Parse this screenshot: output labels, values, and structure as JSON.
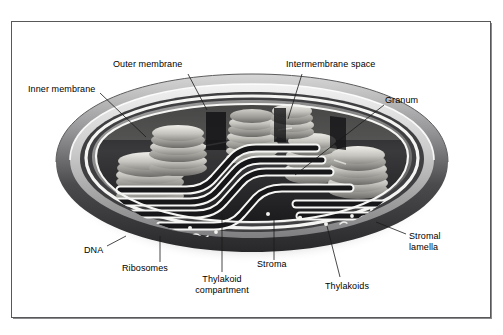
{
  "figure": {
    "kind": "labeled-biological-diagram",
    "background_color": "#ffffff",
    "frame_color": "#58585a",
    "text_color": "#000000",
    "leader_line_color": "#1a1a1a"
  },
  "labels": [
    {
      "id": "inner-membrane",
      "text": "Inner membrane",
      "x": 28,
      "y": 89,
      "align": "left"
    },
    {
      "id": "outer-membrane",
      "text": "Outer membrane",
      "x": 113,
      "y": 64,
      "align": "left"
    },
    {
      "id": "intermembrane-space",
      "text": "Intermembrane space",
      "x": 286,
      "y": 64,
      "align": "left"
    },
    {
      "id": "granum",
      "text": "Granum",
      "x": 385,
      "y": 100,
      "align": "left"
    },
    {
      "id": "stromal-lamella",
      "text": "Stromal lamella",
      "x": 409,
      "y": 231,
      "align": "left",
      "lines": [
        "Stromal",
        "lamella"
      ]
    },
    {
      "id": "thylakoids",
      "text": "Thylakoids",
      "x": 325,
      "y": 281,
      "align": "left"
    },
    {
      "id": "stroma",
      "text": "Stroma",
      "x": 257,
      "y": 264,
      "align": "left"
    },
    {
      "id": "thylakoid-compartment",
      "text": "Thylakoid compartment",
      "x": 190,
      "y": 277,
      "align": "center",
      "lines": [
        "Thylakoid",
        "compartment"
      ]
    },
    {
      "id": "ribosomes",
      "text": "Ribosomes",
      "x": 122,
      "y": 266,
      "align": "left"
    },
    {
      "id": "dna",
      "text": "DNA",
      "x": 84,
      "y": 250,
      "align": "left"
    }
  ],
  "leaders": [
    {
      "id": "leader-inner-membrane",
      "from": [
        100,
        93
      ],
      "to": [
        146,
        137
      ]
    },
    {
      "id": "leader-outer-membrane",
      "from": [
        188,
        74
      ],
      "to": [
        207,
        110
      ]
    },
    {
      "id": "leader-intermembrane-space",
      "from": [
        302,
        74
      ],
      "to": [
        288,
        119
      ]
    },
    {
      "id": "leader-granum",
      "from": [
        384,
        105
      ],
      "to": [
        295,
        175
      ]
    },
    {
      "id": "leader-stromal-lamella",
      "from": [
        406,
        234
      ],
      "to": [
        376,
        222
      ]
    },
    {
      "id": "leader-thylakoids",
      "from": [
        340,
        277
      ],
      "to": [
        327,
        226
      ]
    },
    {
      "id": "leader-stroma",
      "from": [
        274,
        260
      ],
      "to": [
        274,
        219
      ]
    },
    {
      "id": "leader-thylakoid-compartment",
      "from": [
        222,
        272
      ],
      "to": [
        222,
        214
      ]
    },
    {
      "id": "leader-ribosomes",
      "from": [
        160,
        262
      ],
      "to": [
        160,
        236
      ]
    },
    {
      "id": "leader-dna",
      "from": [
        107,
        246
      ],
      "to": [
        126,
        236
      ]
    }
  ],
  "structures": [
    {
      "id": "outer-membrane-shell",
      "name": "outer membrane",
      "description": "outermost dark elliptical envelope of the chloroplast"
    },
    {
      "id": "inner-membrane-shell",
      "name": "inner membrane",
      "description": "second concentric membrane inside the outer membrane"
    },
    {
      "id": "intermembrane-space",
      "name": "intermembrane space",
      "description": "narrow light gap between outer and inner membranes"
    },
    {
      "id": "stroma-body",
      "name": "stroma",
      "description": "fluid matrix filling the interior of the chloroplast"
    },
    {
      "id": "granum-stack",
      "name": "granum",
      "description": "stack of disc-shaped thylakoids"
    },
    {
      "id": "thylakoid-disc",
      "name": "thylakoid",
      "description": "individual flattened membrane disc within a granum"
    },
    {
      "id": "stromal-lamella-ribbon",
      "name": "stromal lamella",
      "description": "flattened tubular membrane connecting adjacent grana"
    },
    {
      "id": "dna-strand",
      "name": "chloroplast DNA",
      "description": "squiggly circular DNA strands lying in the stroma"
    },
    {
      "id": "ribosome-dot",
      "name": "ribosome",
      "description": "small granule scattered through the stroma"
    }
  ],
  "counts": {
    "grana_stacks": 6,
    "stromal_lamellae": 5,
    "dna_strands": 4,
    "ribosomes": 9
  }
}
